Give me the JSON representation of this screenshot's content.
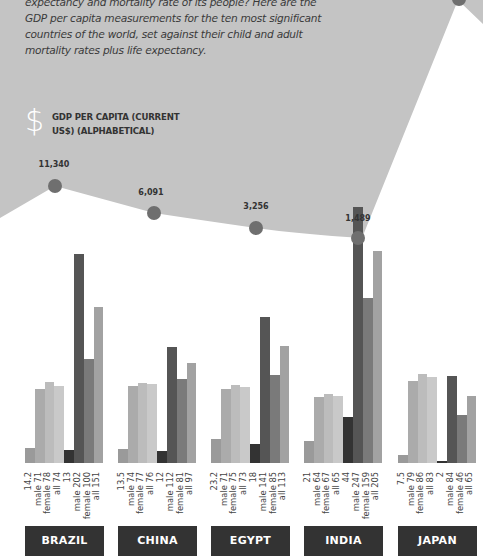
{
  "intro": {
    "text": "expectancy and mortality rate of its people? Here are the GDP per capita measurements for the ten most significant countries of the world, set against their child and adult mortality rates plus life expectancy."
  },
  "gdp_section": {
    "icon": "dollar-icon",
    "icon_glyph": "$",
    "title": "GDP PER CAPITA (CURRENT US$) (ALPHABETICAL)"
  },
  "colors": {
    "background_area": "#c4c4c4",
    "gdp_dot": "#6f6f6f",
    "country_box": "#333333",
    "bars": [
      "#9a9a9a",
      "#ababab",
      "#bcbcbc",
      "#c9c9c9",
      "#333333",
      "#555555",
      "#7a7a7a",
      "#a2a2a2"
    ]
  },
  "chart_data": {
    "type": "bar",
    "title": "GDP per capita (current US$) (alphabetical)",
    "categories": [
      "BRAZIL",
      "CHINA",
      "EGYPT",
      "INDIA",
      "JAPAN"
    ],
    "gdp_per_capita": {
      "type": "line",
      "values": [
        11340,
        6091,
        3256,
        1489,
        null
      ],
      "labels": [
        "11,340",
        "6,091",
        "3,256",
        "1,489",
        ""
      ]
    },
    "bar_series_order": [
      "child mortality",
      "life expectancy male",
      "life expectancy female",
      "life expectancy all",
      "infant/child metric",
      "adult mortality male",
      "adult mortality female",
      "adult mortality all"
    ],
    "groups": [
      {
        "country": "BRAZIL",
        "bars": [
          {
            "label": "14.2",
            "value": 14.2
          },
          {
            "label": "male 71",
            "value": 71
          },
          {
            "label": "female 78",
            "value": 78
          },
          {
            "label": "all 74",
            "value": 74
          },
          {
            "label": "13",
            "value": 13
          },
          {
            "label": "male 202",
            "value": 202
          },
          {
            "label": "female 100",
            "value": 100
          },
          {
            "label": "all 151",
            "value": 151
          }
        ]
      },
      {
        "country": "CHINA",
        "bars": [
          {
            "label": "13.5",
            "value": 13.5
          },
          {
            "label": "male 74",
            "value": 74
          },
          {
            "label": "female 77",
            "value": 77
          },
          {
            "label": "all 76",
            "value": 76
          },
          {
            "label": "12",
            "value": 12
          },
          {
            "label": "male 112",
            "value": 112
          },
          {
            "label": "female 81",
            "value": 81
          },
          {
            "label": "all 97",
            "value": 97
          }
        ]
      },
      {
        "country": "EGYPT",
        "bars": [
          {
            "label": "23.2",
            "value": 23.2
          },
          {
            "label": "male 71",
            "value": 71
          },
          {
            "label": "female 75",
            "value": 75
          },
          {
            "label": "all 73",
            "value": 73
          },
          {
            "label": "18",
            "value": 18
          },
          {
            "label": "male 141",
            "value": 141
          },
          {
            "label": "female 85",
            "value": 85
          },
          {
            "label": "all 113",
            "value": 113
          }
        ]
      },
      {
        "country": "INDIA",
        "bars": [
          {
            "label": "21",
            "value": 21
          },
          {
            "label": "male 64",
            "value": 64
          },
          {
            "label": "female 67",
            "value": 67
          },
          {
            "label": "all 65",
            "value": 65
          },
          {
            "label": "44",
            "value": 44
          },
          {
            "label": "male 247",
            "value": 247
          },
          {
            "label": "female 159",
            "value": 159
          },
          {
            "label": "all 205",
            "value": 205
          }
        ]
      },
      {
        "country": "JAPAN",
        "bars": [
          {
            "label": "7.5",
            "value": 7.5
          },
          {
            "label": "male 79",
            "value": 79
          },
          {
            "label": "female 86",
            "value": 86
          },
          {
            "label": "all 83",
            "value": 83
          },
          {
            "label": "2",
            "value": 2
          },
          {
            "label": "male 84",
            "value": 84
          },
          {
            "label": "female 46",
            "value": 46
          },
          {
            "label": "all 65",
            "value": 65
          }
        ]
      }
    ],
    "xlabel": "",
    "ylabel": "",
    "grid": false,
    "legend": "none"
  }
}
